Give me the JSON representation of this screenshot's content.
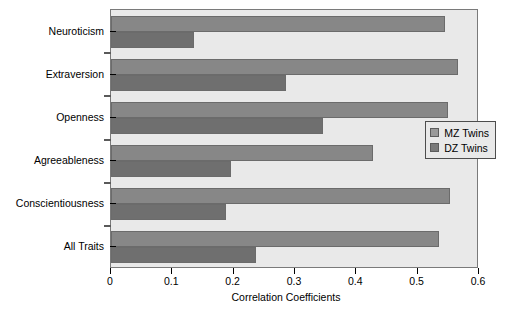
{
  "chart_data": {
    "type": "bar",
    "orientation": "horizontal",
    "title": "",
    "xlabel": "Correlation Coefficients",
    "ylabel": "",
    "xlim": [
      0,
      0.6
    ],
    "xticks": [
      "0",
      "0.1",
      "0.2",
      "0.3",
      "0.4",
      "0.5",
      "0.6"
    ],
    "xtick_values": [
      0,
      0.1,
      0.2,
      0.3,
      0.4,
      0.5,
      0.6
    ],
    "grid": false,
    "legend_position": "center-right",
    "categories": [
      "Neuroticism",
      "Extraversion",
      "Openness",
      "Agreeableness",
      "Conscientiousness",
      "All Traits"
    ],
    "series": [
      {
        "name": "MZ Twins",
        "color": "#878787",
        "values": [
          0.545,
          0.565,
          0.55,
          0.427,
          0.552,
          0.535
        ]
      },
      {
        "name": "DZ Twins",
        "color": "#6f6f6f",
        "values": [
          0.135,
          0.285,
          0.346,
          0.196,
          0.188,
          0.237
        ]
      }
    ]
  },
  "legend": {
    "items": [
      {
        "label": "MZ Twins",
        "swatch": "mz"
      },
      {
        "label": "DZ Twins",
        "swatch": "dz"
      }
    ]
  },
  "colors": {
    "plot_background": "#e9e9e9",
    "plot_border": "#7a7a7a",
    "mz_bar": "#878787",
    "dz_bar": "#6f6f6f",
    "text": "#000000"
  }
}
